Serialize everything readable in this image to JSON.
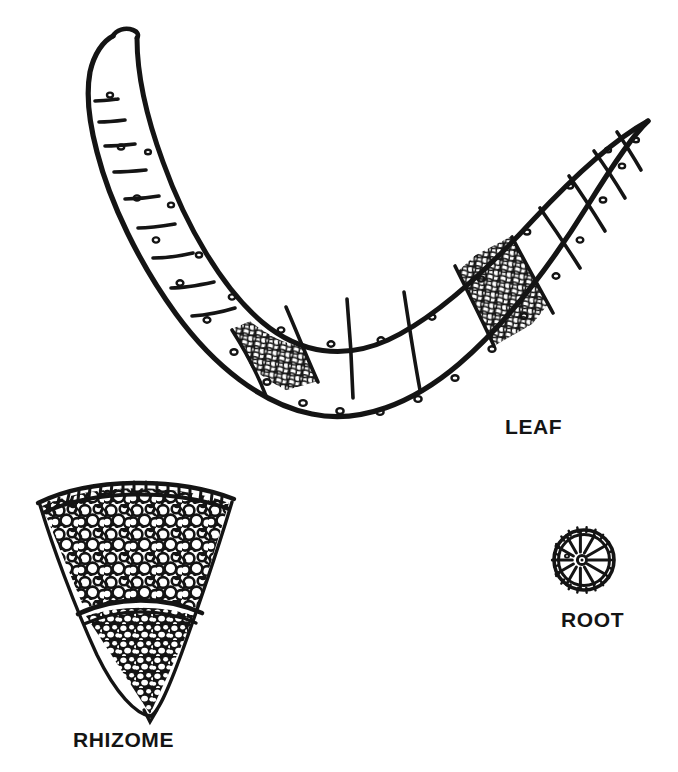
{
  "figure": {
    "background_color": "#ffffff",
    "ink_color": "#141414",
    "style": "black-and-white line drawing",
    "width": 678,
    "height": 772
  },
  "labels": {
    "leaf": "LEAF",
    "rhizome": "RHIZOME",
    "root": "ROOT"
  },
  "specimens": [
    {
      "id": "leaf",
      "label": "LEAF",
      "shape": "crescent",
      "description": "Curved crescent-shaped leaf cross-section with large air chambers separated by thin septa, two reticulated mesh tissue regions, and small vascular bundles along the margins",
      "chamber_count": 14,
      "reticulate_regions": 2
    },
    {
      "id": "rhizome",
      "label": "RHIZOME",
      "shape": "wedge-sector",
      "description": "Pie-wedge sector of a rhizome cross-section: outer epidermis row of small rectangular cells, a broad cortex of large rounded parenchyma cells, an arc-shaped endodermis, and an inner stele of denser small cells",
      "zones": [
        "epidermis",
        "cortex",
        "endodermis",
        "stele"
      ]
    },
    {
      "id": "root",
      "label": "ROOT",
      "shape": "circle",
      "description": "Small circular root cross-section with a beaded epidermal ring and radiating spokes converging on a central stele",
      "spoke_count": 10
    }
  ]
}
